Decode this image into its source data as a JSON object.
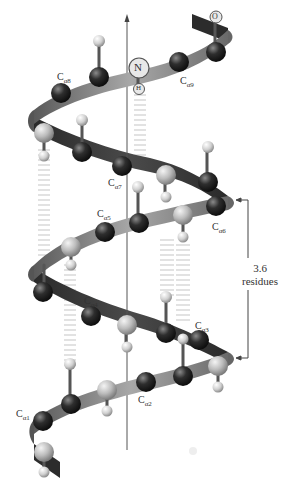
{
  "figure": {
    "axis": "helix-axis-arrow",
    "colors": {
      "ribbon_front": "#8a8a8a",
      "ribbon_back": "#3c3c3c",
      "carbon_alpha": "#2a2a2a",
      "carbonyl_carbon": "#b8b8b8",
      "hydrogen": "#d4d4d4",
      "hbond": "#c8c8c8",
      "text": "#333333"
    },
    "labels": {
      "ca1": "C",
      "ca1_sub": "α1",
      "ca2": "C",
      "ca2_sub": "α2",
      "ca3": "C",
      "ca3_sub": "α3",
      "ca4": "C",
      "ca4_sub": "α4",
      "ca5": "C",
      "ca5_sub": "α5",
      "ca6": "C",
      "ca6_sub": "α6",
      "ca7": "C",
      "ca7_sub": "α7",
      "ca8": "C",
      "ca8_sub": "α8",
      "ca9": "C",
      "ca9_sub": "α9",
      "nitrogen": "N",
      "hydrogen": "H",
      "oxygen": "O"
    },
    "pitch": {
      "value": "3.6",
      "unit": "residues"
    }
  }
}
